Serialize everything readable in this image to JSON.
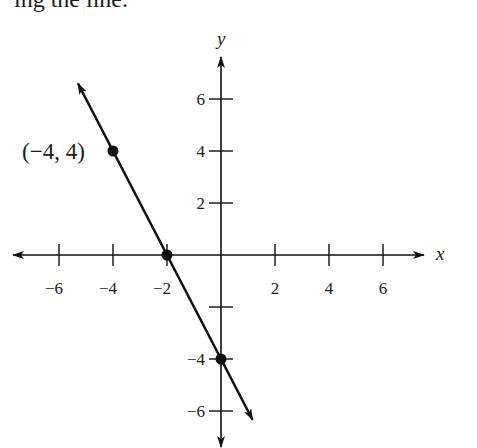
{
  "caption": "ing the line.",
  "chart_data": {
    "type": "line",
    "title": "",
    "xlabel": "x",
    "ylabel": "y",
    "xlim": [
      -7.5,
      7.5
    ],
    "ylim": [
      -7,
      7
    ],
    "grid": false,
    "x_ticks": [
      -6,
      -4,
      -2,
      2,
      4,
      6
    ],
    "y_ticks": [
      6,
      4,
      2,
      -2,
      -4,
      -6
    ],
    "x_tick_labels": [
      "−6",
      "−4",
      "−2",
      "2",
      "4",
      "6"
    ],
    "y_tick_labels": [
      "6",
      "4",
      "2",
      "",
      "−4",
      "−6"
    ],
    "line": {
      "slope": -2,
      "intercept": -4,
      "x_start": -5.3,
      "x_end": 1.17,
      "arrows": "both"
    },
    "points": [
      {
        "x": -4,
        "y": 4,
        "label": "(−4, 4)"
      },
      {
        "x": -2,
        "y": 0,
        "label": ""
      },
      {
        "x": 0,
        "y": -4,
        "label": ""
      }
    ]
  }
}
